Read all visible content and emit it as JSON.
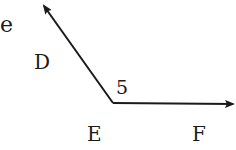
{
  "diagram": {
    "type": "angle",
    "labels": {
      "partial_text": "e",
      "ray_point": "D",
      "angle_number": "5",
      "vertex": "E",
      "other_point": "F"
    },
    "colors": {
      "stroke": "#1a1a1a",
      "background": "#ffffff"
    }
  }
}
